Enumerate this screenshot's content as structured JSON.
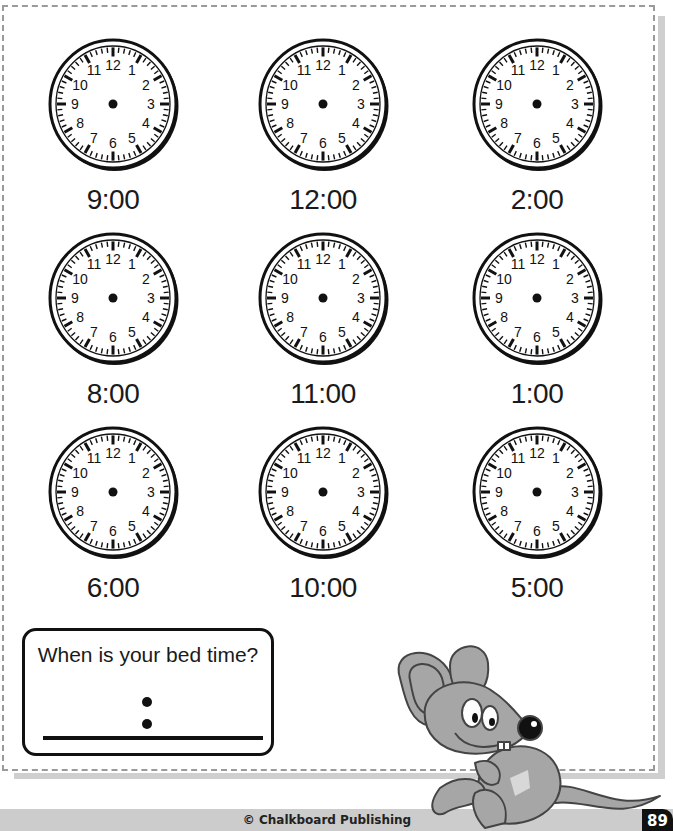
{
  "worksheet": {
    "clocks": [
      {
        "time": "9:00",
        "cx": 113,
        "cy": 104
      },
      {
        "time": "12:00",
        "cx": 323,
        "cy": 104
      },
      {
        "time": "2:00",
        "cx": 537,
        "cy": 104
      },
      {
        "time": "8:00",
        "cx": 113,
        "cy": 298
      },
      {
        "time": "11:00",
        "cx": 323,
        "cy": 298
      },
      {
        "time": "1:00",
        "cx": 537,
        "cy": 298
      },
      {
        "time": "6:00",
        "cx": 113,
        "cy": 492
      },
      {
        "time": "10:00",
        "cx": 323,
        "cy": 492
      },
      {
        "time": "5:00",
        "cx": 537,
        "cy": 492
      }
    ],
    "clock_numerals": [
      "12",
      "1",
      "2",
      "3",
      "4",
      "5",
      "6",
      "7",
      "8",
      "9",
      "10",
      "11"
    ],
    "bedtime_box": {
      "question": "When is your bed time?",
      "answer_separator": ":"
    }
  },
  "illustration": {
    "icon": "cartoon-mouse-icon",
    "body_color": "#a6a6a6",
    "outline_color": "#444444"
  },
  "footer": {
    "copyright": "© Chalkboard Publishing",
    "page_number": "89"
  },
  "colors": {
    "border": "#9a9a9a",
    "shadow": "#cfcfcf",
    "footer_band": "#cccccc",
    "ink": "#111111"
  }
}
